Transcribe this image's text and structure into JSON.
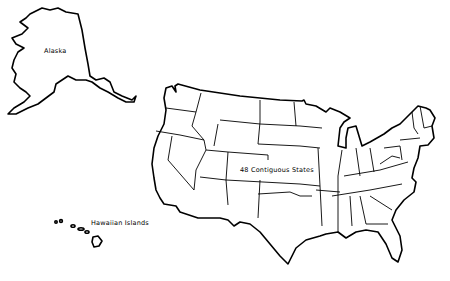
{
  "map": {
    "regions": [
      {
        "name": "alaska",
        "label": "Alaska"
      },
      {
        "name": "hawaii",
        "label": "Hawaiian Islands"
      },
      {
        "name": "contiguous-us",
        "label": "48 Contiguous States"
      }
    ],
    "colors": {
      "stroke": "#000000",
      "fill": "#ffffff"
    }
  }
}
